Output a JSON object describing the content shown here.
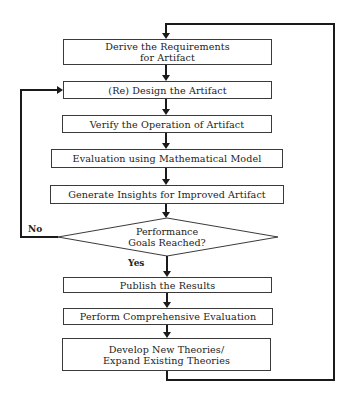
{
  "diagram": {
    "type": "flowchart",
    "nodes": [
      {
        "id": "derive",
        "lines": [
          "Derive the Requirements",
          "for Artifact"
        ]
      },
      {
        "id": "design",
        "lines": [
          "(Re) Design the Artifact"
        ]
      },
      {
        "id": "verify",
        "lines": [
          "Verify the Operation of Artifact"
        ]
      },
      {
        "id": "evaluate",
        "lines": [
          "Evaluation using Mathematical Model"
        ]
      },
      {
        "id": "insights",
        "lines": [
          "Generate Insights for Improved Artifact"
        ]
      },
      {
        "id": "decision",
        "shape": "diamond",
        "lines": [
          "Performance",
          "Goals Reached?"
        ]
      },
      {
        "id": "publish",
        "lines": [
          "Publish the Results"
        ]
      },
      {
        "id": "comprehensive",
        "lines": [
          "Perform Comprehensive Evaluation"
        ]
      },
      {
        "id": "theories",
        "lines": [
          "Develop New Theories/",
          "Expand Existing Theories"
        ]
      }
    ],
    "edges": [
      {
        "from": "derive",
        "to": "design"
      },
      {
        "from": "design",
        "to": "verify"
      },
      {
        "from": "verify",
        "to": "evaluate"
      },
      {
        "from": "evaluate",
        "to": "insights"
      },
      {
        "from": "insights",
        "to": "decision"
      },
      {
        "from": "decision",
        "to": "design",
        "label": "No"
      },
      {
        "from": "decision",
        "to": "publish",
        "label": "Yes"
      },
      {
        "from": "publish",
        "to": "comprehensive"
      },
      {
        "from": "comprehensive",
        "to": "theories"
      },
      {
        "from": "theories",
        "to": "derive"
      }
    ],
    "labels": {
      "no": "No",
      "yes": "Yes"
    },
    "colors": {
      "line": "#1a1a1a",
      "box_border": "#3a3a3a",
      "background": "#ffffff"
    }
  }
}
